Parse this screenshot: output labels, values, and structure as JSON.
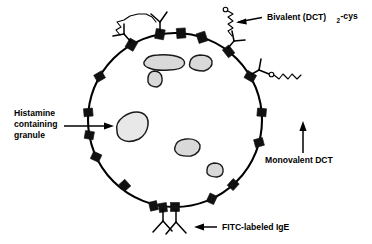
{
  "figure": {
    "type": "schematic-diagram",
    "background_color": "#ffffff",
    "ink_color": "#000000",
    "granule_fill": "#d9d9d9",
    "receptor_color": "#111111"
  },
  "labels": {
    "bivalent": {
      "text_before": "Bivalent (DCT)",
      "subscript": "2",
      "text_after": "-cys",
      "full_text": "Bivalent (DCT)2-cys",
      "arrow_direction": "left"
    },
    "histamine": {
      "line1": "Histamine",
      "line2": "containing",
      "line3": "granule",
      "full_text": "Histamine containing granule",
      "arrow_direction": "right"
    },
    "monovalent": {
      "text": "Monovalent DCT",
      "arrow_direction": "up"
    },
    "fitc": {
      "text": "FITC-labeled IgE",
      "arrow_direction": "left"
    }
  },
  "cell": {
    "center_x": 175,
    "center_y": 120,
    "radius": 87,
    "name": "mast-cell-membrane"
  },
  "granules": [
    {
      "id": "granule-1",
      "cx": 163,
      "cy": 62,
      "rx": 20,
      "ry": 8,
      "rot": -8,
      "tone": "mid"
    },
    {
      "id": "granule-2",
      "cx": 201,
      "cy": 63,
      "rx": 11,
      "ry": 8,
      "rot": 5,
      "tone": "mid"
    },
    {
      "id": "granule-3",
      "cx": 155,
      "cy": 79,
      "rx": 7,
      "ry": 8,
      "rot": 0,
      "tone": "mid"
    },
    {
      "id": "granule-4",
      "cx": 131,
      "cy": 126,
      "rx": 17,
      "ry": 12,
      "rot": -30,
      "tone": "light"
    },
    {
      "id": "granule-5",
      "cx": 187,
      "cy": 148,
      "rx": 12,
      "ry": 8,
      "rot": 0,
      "tone": "mid"
    },
    {
      "id": "granule-6",
      "cx": 215,
      "cy": 170,
      "rx": 8,
      "ry": 6,
      "rot": 10,
      "tone": "mid"
    }
  ],
  "receptors": [
    {
      "id": "receptor-1",
      "angle": 255
    },
    {
      "id": "receptor-2",
      "angle": 262
    },
    {
      "id": "receptor-3",
      "angle": 272
    },
    {
      "id": "receptor-4",
      "angle": 295
    },
    {
      "id": "receptor-5",
      "angle": 312
    },
    {
      "id": "receptor-6",
      "angle": 345
    },
    {
      "id": "receptor-7",
      "angle": 5
    },
    {
      "id": "receptor-8",
      "angle": 30
    },
    {
      "id": "receptor-9",
      "angle": 52
    },
    {
      "id": "receptor-10",
      "angle": 72
    },
    {
      "id": "receptor-11",
      "angle": 86
    },
    {
      "id": "receptor-12",
      "angle": 100
    },
    {
      "id": "receptor-13",
      "angle": 120
    },
    {
      "id": "receptor-14",
      "angle": 150
    },
    {
      "id": "receptor-15",
      "angle": 175
    },
    {
      "id": "receptor-16",
      "angle": 190
    },
    {
      "id": "receptor-17",
      "angle": 205
    },
    {
      "id": "receptor-18",
      "angle": 228
    }
  ],
  "ige_molecules": [
    {
      "id": "ige-top-left",
      "angle": 120,
      "note": "cross-linked by bivalent DCT"
    },
    {
      "id": "ige-top-right",
      "angle": 100,
      "note": "cross-linked by bivalent DCT"
    },
    {
      "id": "ige-upper-right",
      "angle": 52,
      "note": "bound by free bivalent DCT"
    },
    {
      "id": "ige-right",
      "angle": 30,
      "note": "bound by monovalent DCT"
    },
    {
      "id": "ige-bottom-1",
      "angle": 262,
      "note": "unoccupied"
    },
    {
      "id": "ige-bottom-2",
      "angle": 272,
      "note": "unoccupied, FITC-labeled IgE callout"
    }
  ],
  "haptens": [
    {
      "id": "bivalent-crosslink",
      "type": "bivalent",
      "state": "cross-linking two IgE"
    },
    {
      "id": "bivalent-free",
      "type": "bivalent",
      "state": "singly bound, one free arm"
    },
    {
      "id": "monovalent-bound",
      "type": "monovalent",
      "state": "bound to one IgE site"
    }
  ]
}
